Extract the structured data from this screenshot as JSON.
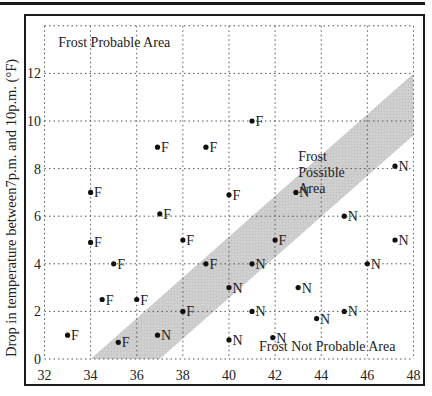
{
  "chart_data": {
    "type": "scatter",
    "title": "",
    "xlabel": "",
    "ylabel": "Drop in temperature between7p.m. and 10p.m. (°F)",
    "xlim": [
      32,
      48
    ],
    "ylim": [
      0,
      14
    ],
    "x_ticks": [
      32,
      34,
      36,
      38,
      40,
      42,
      44,
      46,
      48
    ],
    "y_ticks": [
      0,
      2,
      4,
      6,
      8,
      10,
      12
    ],
    "grid": true,
    "legend": null,
    "annotations": [
      {
        "text": "Frost Probable Area",
        "x": 32.6,
        "y": 13.1
      },
      {
        "text": "Frost Possible Area",
        "lines": [
          "Frost",
          "Possible",
          "Area"
        ],
        "x": 43.0,
        "y": 8.3
      },
      {
        "text": "Frost Not Probable Area",
        "x": 41.3,
        "y": 0.35
      }
    ],
    "band": {
      "name": "Frost Possible Area",
      "color": "#cccccc",
      "polygon": [
        [
          34,
          0
        ],
        [
          37,
          0
        ],
        [
          48,
          9.4
        ],
        [
          48,
          12
        ]
      ]
    },
    "series": [
      {
        "name": "F",
        "label": "F (frost)",
        "points": [
          [
            41.0,
            10.0
          ],
          [
            36.9,
            8.9
          ],
          [
            39.0,
            8.9
          ],
          [
            34.0,
            7.0
          ],
          [
            37.0,
            6.1
          ],
          [
            40.0,
            6.9
          ],
          [
            34.0,
            4.9
          ],
          [
            38.0,
            5.0
          ],
          [
            42.0,
            5.0
          ],
          [
            35.0,
            4.0
          ],
          [
            39.0,
            4.0
          ],
          [
            34.5,
            2.5
          ],
          [
            36.0,
            2.5
          ],
          [
            38.0,
            2.0
          ],
          [
            33.0,
            1.0
          ],
          [
            35.2,
            0.7
          ]
        ]
      },
      {
        "name": "N",
        "label": "N (no frost)",
        "points": [
          [
            47.2,
            8.1
          ],
          [
            42.9,
            7.0
          ],
          [
            45.0,
            6.0
          ],
          [
            47.2,
            5.0
          ],
          [
            41.0,
            4.0
          ],
          [
            46.0,
            4.0
          ],
          [
            40.0,
            3.0
          ],
          [
            43.0,
            3.0
          ],
          [
            36.9,
            1.0
          ],
          [
            41.0,
            2.0
          ],
          [
            45.0,
            2.0
          ],
          [
            43.8,
            1.7
          ],
          [
            40.0,
            0.8
          ],
          [
            41.9,
            0.9
          ]
        ]
      }
    ]
  }
}
